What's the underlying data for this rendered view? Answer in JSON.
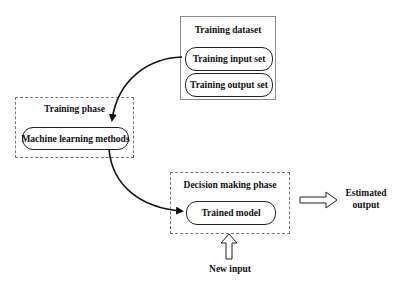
{
  "training_dataset": {
    "title": "Training dataset",
    "items": [
      {
        "label": "Training input set"
      },
      {
        "label": "Training output set"
      }
    ]
  },
  "training_phase": {
    "title": "Training phase",
    "items": [
      {
        "label": "Machine learning methods"
      }
    ]
  },
  "decision_phase": {
    "title": "Decision making phase",
    "items": [
      {
        "label": "Trained model"
      }
    ]
  },
  "outputs": {
    "estimated_output_line1": "Estimated",
    "estimated_output_line2": "output"
  },
  "inputs": {
    "new_input": "New input"
  },
  "colors": {
    "solid_border": "#8a8a8a",
    "dashed_border": "#777777",
    "stroke": "#111111"
  }
}
